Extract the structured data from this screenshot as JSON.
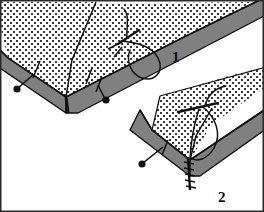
{
  "illustration": {
    "title": "Mitered corner hand-sewing steps",
    "type": "line-illustration",
    "width": 264,
    "height": 212,
    "background_color": "#ffffff",
    "border_color": "#2a2a2a",
    "colors": {
      "fabric_fill": "#ffffff",
      "fabric_dot": "#3a3a3a",
      "band_gray": "#808080",
      "outline": "#111111",
      "thread": "#111111",
      "pin_head": "#111111"
    },
    "figures": [
      {
        "id": "figure-1",
        "label": "1",
        "label_x": 172,
        "label_y": 62,
        "caption": "",
        "description": "Mitered corner with needle and thread looping through the folded binding edge, two pins holding the binding.",
        "pins": 2,
        "has_needle": true,
        "has_thread_loop": true
      },
      {
        "id": "figure-2",
        "label": "2",
        "label_x": 218,
        "label_y": 200,
        "caption": "",
        "description": "Mitered corner with thread pulled and ladder stitches closing the miter seam, one pin remaining.",
        "pins": 1,
        "has_needle": true,
        "has_thread_loop": true,
        "has_corner_stitches": true
      }
    ],
    "pin_markers": [
      {
        "name": "pin-1",
        "head_x": 17,
        "head_y": 88,
        "tip_x": 33,
        "tip_y": 75
      },
      {
        "name": "pin-2",
        "head_x": 105,
        "head_y": 99,
        "tip_x": 97,
        "tip_y": 84
      },
      {
        "name": "pin-3",
        "head_x": 142,
        "head_y": 163,
        "tip_x": 162,
        "tip_y": 148
      }
    ]
  }
}
